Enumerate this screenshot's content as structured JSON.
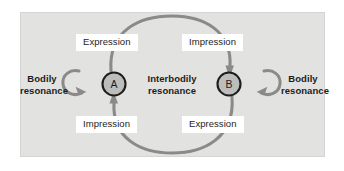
{
  "figure": {
    "background_color": "#ffffff",
    "panel_color": "#e2e2e0",
    "arc_color": "#8a8a88",
    "node_fill": "#bdbdbb",
    "node_stroke": "#1d1d1b",
    "label_box_color": "#ffffff",
    "text_color": "#1d1d1b"
  },
  "nodes": [
    {
      "id": "A",
      "letter": "A",
      "cx": 114,
      "cy": 84,
      "r": 12
    },
    {
      "id": "B",
      "letter": "B",
      "cx": 229,
      "cy": 84,
      "r": 12
    }
  ],
  "arc_labels": {
    "expression_top": "Expression",
    "impression_top": "Impression",
    "impression_bottom": "Impression",
    "expression_bottom": "Expression"
  },
  "side_labels": {
    "bodily_left_line1": "Bodily",
    "bodily_left_line2": "resonance",
    "bodily_right_line1": "Bodily",
    "bodily_right_line2": "resonance"
  },
  "center_label": {
    "line1": "Interbodily",
    "line2": "resonance"
  },
  "arrows": {
    "top_arc": "A-to-B",
    "bottom_arc": "B-to-A",
    "left_self_loop": "A-to-A",
    "right_self_loop": "B-to-B"
  }
}
